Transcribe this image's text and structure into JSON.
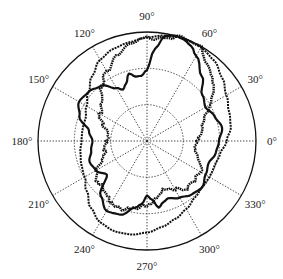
{
  "chart_data": {
    "type": "polar",
    "title": "",
    "angular_ticks": [
      "0°",
      "30°",
      "60°",
      "90°",
      "120°",
      "150°",
      "180°",
      "210°",
      "240°",
      "270°",
      "300°",
      "330°"
    ],
    "angular_tick_values": [
      0,
      30,
      60,
      90,
      120,
      150,
      180,
      210,
      240,
      270,
      300,
      330
    ],
    "radial_rings": [
      0.333,
      0.667,
      1.0
    ],
    "radial_range": [
      0,
      1
    ],
    "grid": true,
    "legend": null,
    "series": [
      {
        "name": "solid",
        "style": "solid-thick",
        "angles": [
          0,
          10,
          20,
          30,
          40,
          50,
          60,
          65,
          70,
          75,
          80,
          85,
          90,
          95,
          100,
          105,
          110,
          115,
          120,
          130,
          140,
          150,
          160,
          170,
          180,
          190,
          200,
          210,
          220,
          230,
          240,
          250,
          260,
          265,
          270,
          275,
          280,
          285,
          290,
          300,
          310,
          320,
          330,
          340,
          350,
          360
        ],
        "r": [
          0.66,
          0.7,
          0.66,
          0.62,
          0.66,
          0.78,
          0.9,
          0.96,
          0.99,
          1.0,
          0.98,
          0.85,
          0.65,
          0.6,
          0.6,
          0.64,
          0.56,
          0.52,
          0.56,
          0.66,
          0.7,
          0.72,
          0.66,
          0.54,
          0.5,
          0.52,
          0.56,
          0.54,
          0.48,
          0.66,
          0.74,
          0.72,
          0.62,
          0.58,
          0.5,
          0.54,
          0.62,
          0.58,
          0.56,
          0.6,
          0.64,
          0.66,
          0.62,
          0.6,
          0.64,
          0.66
        ]
      },
      {
        "name": "dashed",
        "style": "dashed",
        "angles": [
          0,
          10,
          20,
          30,
          40,
          50,
          60,
          70,
          80,
          90,
          100,
          110,
          120,
          130,
          140,
          150,
          160,
          170,
          180,
          190,
          200,
          210,
          220,
          230,
          240,
          250,
          260,
          270,
          280,
          290,
          300,
          310,
          320,
          330,
          340,
          350,
          360
        ],
        "r": [
          0.73,
          0.78,
          0.8,
          0.84,
          0.9,
          0.96,
          0.99,
          1.0,
          0.98,
          0.95,
          0.92,
          0.9,
          0.86,
          0.78,
          0.7,
          0.64,
          0.6,
          0.6,
          0.6,
          0.62,
          0.64,
          0.66,
          0.72,
          0.8,
          0.86,
          0.88,
          0.87,
          0.84,
          0.8,
          0.76,
          0.72,
          0.68,
          0.66,
          0.66,
          0.66,
          0.68,
          0.73
        ]
      },
      {
        "name": "dotted",
        "style": "dotted-jagged",
        "angles": [
          0,
          10,
          20,
          30,
          40,
          50,
          60,
          70,
          80,
          90,
          100,
          110,
          120,
          130,
          140,
          150,
          160,
          170,
          180,
          190,
          200,
          210,
          220,
          230,
          240,
          250,
          260,
          270,
          280,
          290,
          300,
          310,
          320,
          330,
          340,
          350,
          360
        ],
        "r": [
          0.45,
          0.5,
          0.56,
          0.66,
          0.78,
          0.9,
          0.98,
          0.99,
          0.97,
          0.94,
          0.9,
          0.84,
          0.74,
          0.64,
          0.56,
          0.5,
          0.42,
          0.38,
          0.36,
          0.38,
          0.44,
          0.52,
          0.58,
          0.62,
          0.64,
          0.66,
          0.64,
          0.58,
          0.52,
          0.48,
          0.5,
          0.56,
          0.58,
          0.56,
          0.5,
          0.46,
          0.45
        ]
      }
    ]
  },
  "layout": {
    "cx": 147,
    "cy": 141,
    "R": 109,
    "label_offset": 16,
    "colors": {
      "trace": "#111111",
      "grid": "#333333",
      "frame": "#111111",
      "label": "#222222"
    }
  }
}
